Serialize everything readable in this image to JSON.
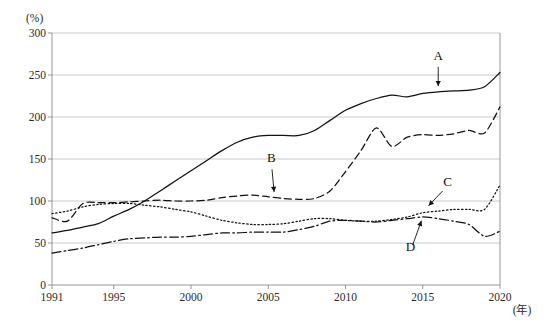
{
  "chart_data": {
    "type": "line",
    "title": "",
    "subtitle": "",
    "xlabel": "(年)",
    "ylabel": "(%)",
    "unit_y": "(%)",
    "unit_x": "(年)",
    "grid": true,
    "legend_position": "inline-annotations",
    "xlim": [
      1991,
      2020
    ],
    "ylim": [
      0,
      300
    ],
    "x_ticks": [
      1991,
      1995,
      2000,
      2005,
      2010,
      2015,
      2020
    ],
    "x_tick_labels": [
      "1991",
      "1995",
      "2000",
      "2005",
      "2010",
      "2015",
      "2020"
    ],
    "y_ticks": [
      0,
      50,
      100,
      150,
      200,
      250,
      300
    ],
    "y_tick_labels": [
      "0",
      "50",
      "100",
      "150",
      "200",
      "250",
      "300"
    ],
    "x": [
      1991,
      1992,
      1993,
      1994,
      1995,
      1996,
      1997,
      1998,
      1999,
      2000,
      2001,
      2002,
      2003,
      2004,
      2005,
      2006,
      2007,
      2008,
      2009,
      2010,
      2011,
      2012,
      2013,
      2014,
      2015,
      2016,
      2017,
      2018,
      2019,
      2020
    ],
    "series": [
      {
        "name": "A",
        "label": "A",
        "style": "solid",
        "color": "#111111",
        "annotation": {
          "label": "A",
          "label_x": 2016,
          "label_y": 268,
          "point_x": 2016,
          "point_y": 232
        },
        "values": [
          62,
          65,
          69,
          73,
          82,
          90,
          100,
          112,
          124,
          136,
          148,
          160,
          170,
          176,
          178,
          178,
          178,
          184,
          196,
          208,
          216,
          222,
          226,
          224,
          228,
          230,
          231,
          232,
          236,
          253
        ]
      },
      {
        "name": "B",
        "label": "B",
        "style": "dashed",
        "color": "#111111",
        "annotation": {
          "label": "B",
          "label_x": 2005.2,
          "label_y": 146,
          "point_x": 2005.4,
          "point_y": 106
        },
        "values": [
          80,
          76,
          97,
          98,
          98,
          99,
          100,
          101,
          100,
          100,
          101,
          104,
          106,
          107,
          105,
          103,
          102,
          103,
          112,
          135,
          160,
          187,
          165,
          176,
          179,
          178,
          180,
          184,
          181,
          212
        ]
      },
      {
        "name": "C",
        "label": "C",
        "style": "dotted",
        "color": "#111111",
        "annotation": {
          "label": "C",
          "label_x": 2016.6,
          "label_y": 118,
          "point_x": 2015.2,
          "point_y": 91
        },
        "values": [
          85,
          88,
          93,
          96,
          97,
          97,
          95,
          93,
          90,
          87,
          82,
          77,
          74,
          72,
          72,
          73,
          76,
          79,
          79,
          77,
          76,
          76,
          78,
          81,
          86,
          88,
          90,
          90,
          90,
          119
        ]
      },
      {
        "name": "D",
        "label": "D",
        "style": "dashdot",
        "color": "#111111",
        "annotation": {
          "label": "D",
          "label_x": 2014.2,
          "label_y": 40,
          "point_x": 2015.0,
          "point_y": 81
        },
        "values": [
          38,
          41,
          44,
          48,
          52,
          55,
          56,
          57,
          57,
          58,
          60,
          62,
          62,
          63,
          63,
          63,
          66,
          70,
          76,
          77,
          76,
          75,
          77,
          79,
          81,
          79,
          76,
          72,
          58,
          64
        ]
      }
    ],
    "annotations": [
      {
        "label": "A",
        "target_series": "A"
      },
      {
        "label": "B",
        "target_series": "B"
      },
      {
        "label": "C",
        "target_series": "C"
      },
      {
        "label": "D",
        "target_series": "D"
      }
    ]
  }
}
